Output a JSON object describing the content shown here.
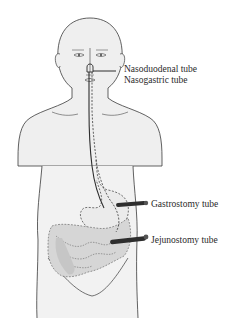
{
  "diagram": {
    "labels": {
      "nasoduodenal": "Nasoduodenal tube",
      "nasogastric": "Nasogastric tube",
      "gastrostomy": "Gastrostomy tube",
      "jejunostomy": "Jejunostomy tube"
    },
    "colors": {
      "body_fill": "#efefef",
      "outline": "#3a3a3a",
      "stomach_fill": "#e9e9e9",
      "intestine_fill": "#c8c8c8",
      "tube": "#2e2e2e",
      "label_text": "#2a2a2a"
    }
  }
}
